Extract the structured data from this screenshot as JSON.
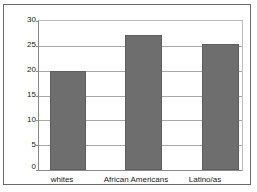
{
  "chart_data": {
    "type": "bar",
    "title": "",
    "subtitle": "",
    "xlabel": "",
    "ylabel": "",
    "categories": [
      "whites",
      "African Americans",
      "Latino/as"
    ],
    "values": [
      20,
      27.2,
      25.3
    ],
    "ylim": [
      0,
      30
    ],
    "yticks": [
      0,
      5,
      10,
      15,
      20,
      25,
      30
    ],
    "ytick_labels": [
      "0",
      "5",
      "10",
      "15",
      "20",
      "25",
      "30"
    ],
    "grid": true,
    "legend": false,
    "legend_position": "none",
    "bar_color": "#6e6e6e",
    "plot_background": "#ffffff",
    "gridline_color": "#a9a9a9",
    "axis_color": "#8a8a8a",
    "frame_color": "#6b6b6b"
  }
}
